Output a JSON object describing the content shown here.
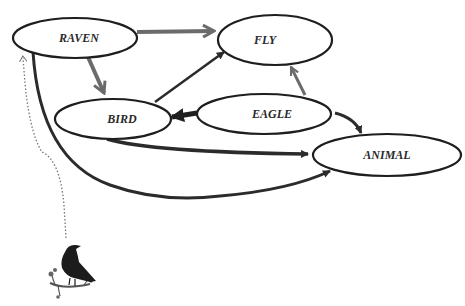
{
  "diagram": {
    "nodes": [
      {
        "id": "raven",
        "label": "RAVEN",
        "cx": 75,
        "cy": 38,
        "rx": 62,
        "ry": 20
      },
      {
        "id": "fly",
        "label": "FLY",
        "cx": 275,
        "cy": 40,
        "rx": 58,
        "ry": 25
      },
      {
        "id": "bird",
        "label": "BIRD",
        "cx": 113,
        "cy": 119,
        "rx": 58,
        "ry": 20
      },
      {
        "id": "eagle",
        "label": "EAGLE",
        "cx": 264,
        "cy": 114,
        "rx": 67,
        "ry": 20
      },
      {
        "id": "animal",
        "label": "ANIMAL",
        "cx": 387,
        "cy": 155,
        "rx": 75,
        "ry": 21
      }
    ],
    "edges": [
      {
        "from": "raven",
        "to": "fly",
        "style": "gray-thick"
      },
      {
        "from": "raven",
        "to": "bird",
        "style": "gray-thick"
      },
      {
        "from": "bird",
        "to": "fly",
        "style": "dark"
      },
      {
        "from": "eagle",
        "to": "bird",
        "style": "dark-thick"
      },
      {
        "from": "eagle",
        "to": "fly",
        "style": "gray"
      },
      {
        "from": "eagle",
        "to": "animal",
        "style": "dark"
      },
      {
        "from": "bird",
        "to": "animal",
        "style": "dark"
      },
      {
        "from": "raven",
        "to": "animal",
        "style": "dark-curved"
      },
      {
        "from": "raven-image",
        "to": "raven",
        "style": "dotted"
      }
    ],
    "image": {
      "name": "raven-illustration",
      "description": "raven perched on branch"
    },
    "colors": {
      "dark_edge": "#2b2b2b",
      "gray_edge": "#6b6b6b",
      "node_stroke": "#1e1e1e"
    }
  }
}
